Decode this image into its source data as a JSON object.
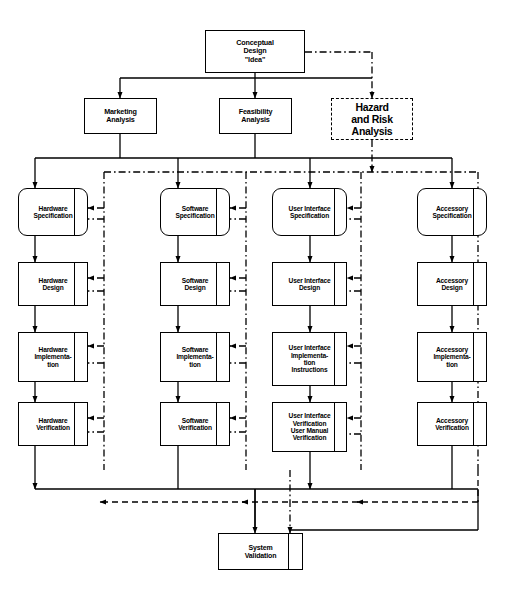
{
  "diagram": {
    "type": "flowchart",
    "nodes": {
      "conceptual_design": "Conceptual\nDesign\n\"Idea\"",
      "marketing_analysis": "Marketing\nAnalysis",
      "feasibility_analysis": "Feasibility\nAnalysis",
      "hazard_risk_analysis": "Hazard\nand Risk\nAnalysis",
      "hardware_specification": "Hardware\nSpecification",
      "hardware_design": "Hardware\nDesign",
      "hardware_implementation": "Hardware\nImplementa-\ntion",
      "hardware_verification": "Hardware\nVerification",
      "software_specification": "Software\nSpecification",
      "software_design": "Software\nDesign",
      "software_implementation": "Software\nImplementa-\ntion",
      "software_verification": "Software\nVerification",
      "ui_specification": "User Interface\nSpecification",
      "ui_design": "User Interface\nDesign",
      "ui_implementation": "User Interface\nImplementa-\ntion\nInstructions",
      "ui_verification": "User Interface\nVerification\nUser Manual\nVerification",
      "accessory_specification": "Accessory\nSpecification",
      "accessory_design": "Accessory\nDesign",
      "accessory_implementation": "Accessory\nImplementa-\ntion",
      "accessory_verification": "Accessory\nVerification",
      "system_validation": "System\nValidation"
    },
    "columns": [
      "Hardware",
      "Software",
      "User Interface",
      "Accessory"
    ],
    "rows": [
      "Specification",
      "Design",
      "Implementation",
      "Verification"
    ],
    "colors": {
      "line": "#000000",
      "background": "#ffffff",
      "text": "#000000"
    },
    "edge_styles": {
      "process_flow": "solid",
      "hazard_risk_flow": "dash-dot",
      "validation_feedback": "dashed"
    }
  }
}
